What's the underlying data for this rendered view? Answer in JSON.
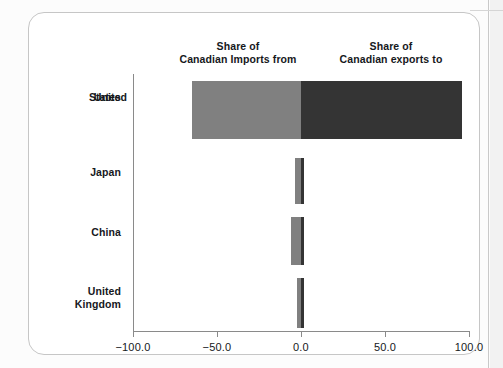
{
  "chart_data": {
    "type": "bar",
    "orientation": "horizontal",
    "subtype": "diverging-paired",
    "title": "",
    "subtitle": "",
    "xlabel": "",
    "ylabel": "",
    "xlim": [
      -100.0,
      100.0
    ],
    "xticks": [
      -100.0,
      -50.0,
      0.0,
      50.0,
      100.0
    ],
    "xtick_labels": [
      "−100.0",
      "−50.0",
      "0.0",
      "50.0",
      "100.0"
    ],
    "grid": false,
    "legend_position": "top-as-column-headers",
    "categories": [
      "United States",
      "Japan",
      "China",
      "United Kingdom"
    ],
    "series": [
      {
        "name": "Share of Canadian Imports from",
        "color": "#808080",
        "sign": "negative",
        "values": [
          -65.0,
          -3.5,
          -6.0,
          -2.5
        ]
      },
      {
        "name": "Share of Canadian exports to",
        "color": "#343434",
        "sign": "positive",
        "values": [
          96.0,
          2.0,
          2.0,
          2.0
        ]
      }
    ]
  },
  "headers": {
    "imports_line1": "Share of",
    "imports_line2": "Canadian Imports from",
    "exports_line1": "Share of",
    "exports_line2": "Canadian exports to"
  },
  "axis": {
    "tick_labels": [
      "−100.0",
      "−50.0",
      "0.0",
      "50.0",
      "100.0"
    ]
  },
  "categories": [
    {
      "line1": "United",
      "line2": "States"
    },
    {
      "line1": "Japan",
      "line2": ""
    },
    {
      "line1": "China",
      "line2": ""
    },
    {
      "line1": "United",
      "line2": "Kingdom"
    }
  ],
  "colors": {
    "imports": "#808080",
    "exports": "#343434",
    "axis": "#8a8a8a",
    "frame": "#c6c6c6",
    "text": "#16181c"
  }
}
